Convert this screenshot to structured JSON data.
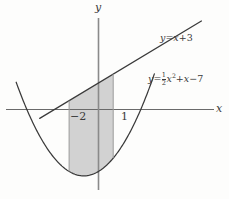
{
  "figure": {
    "background_color": "#fdfdfc",
    "stroke_color": "#3a3a3a",
    "fill_color": "#d2d2d2"
  },
  "axes": {
    "x_label": "x",
    "y_label": "y",
    "x_ticks": [
      {
        "label": "−2",
        "value": -2
      },
      {
        "label": "1",
        "value": 1
      }
    ]
  },
  "labels": {
    "line_equation": {
      "lhs": "y",
      "equals": "=",
      "rhs_var": "x",
      "rhs_op": "+",
      "rhs_const": "3",
      "text": "y = x + 3"
    },
    "parabola_equation": {
      "lhs": "y",
      "equals": "=",
      "frac_num": "1",
      "frac_den": "2",
      "var": "x",
      "power": "2",
      "op1": "+",
      "term2": "x",
      "op2": "−",
      "const": "7",
      "text": "y = 1/2 x^2 + x − 7"
    }
  },
  "chart_data": {
    "type": "line",
    "title": "",
    "xlabel": "x",
    "ylabel": "y",
    "xlim": [
      -4.0,
      8.9
    ],
    "ylim": [
      -12.0,
      10.2
    ],
    "grid": false,
    "legend": "none",
    "series": [
      {
        "name": "y = x + 3",
        "type": "line",
        "kind": "linear",
        "slope": 1,
        "intercept": 3,
        "x_range": [
          -4.0,
          7.0
        ],
        "color": "#3a3a3a"
      },
      {
        "name": "y = 1/2 x^2 + x - 7",
        "type": "line",
        "kind": "quadratic",
        "a": 0.5,
        "b": 1,
        "c": -7,
        "vertex": [
          -1,
          -7.5
        ],
        "x_range": [
          -5.6,
          3.8
        ],
        "color": "#3a3a3a"
      }
    ],
    "shaded_region": {
      "label": "area between line and parabola",
      "x_from": -2,
      "x_to": 1,
      "upper": "y = x + 3",
      "lower": "y = 1/2 x^2 + x - 7",
      "fill": "#d2d2d2"
    },
    "intersections": [
      {
        "x": -4.0,
        "y": -1.0
      },
      {
        "x": 5.0,
        "y": 8.0
      }
    ],
    "annotations": [
      {
        "text": "y = x + 3",
        "x": 5.6,
        "y": 7.4
      },
      {
        "text": "y = 1/2 x^2 + x − 7",
        "x": 4.6,
        "y": 3.2
      },
      {
        "text": "−2",
        "x": -2.3,
        "y": -1.5
      },
      {
        "text": "1",
        "x": 1.3,
        "y": -1.5
      }
    ]
  }
}
